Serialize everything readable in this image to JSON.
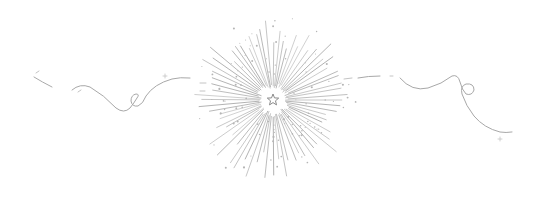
{
  "image": {
    "kind": "decorative-divider",
    "background": "#ffffff",
    "ink_color": "#9a9a9a",
    "light_ink_color": "#c2c2c2",
    "width": 542,
    "height": 199
  },
  "starburst": {
    "center": [
      273,
      100
    ],
    "inner_radius": 12,
    "ray_count": 72,
    "min_length": 52,
    "max_length": 82,
    "dot_count": 90
  },
  "center_star": {
    "points": 5,
    "outer_radius": 6,
    "inner_radius": 2.6
  },
  "left_flourish": {
    "direction": "left",
    "has_loop": true
  },
  "right_flourish": {
    "direction": "right",
    "has_loop": true
  }
}
